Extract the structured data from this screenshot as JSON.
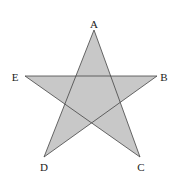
{
  "diagram": {
    "type": "pentagram",
    "fill": "#c8c8c8",
    "stroke": "#444444",
    "vertices": [
      {
        "label": "A",
        "x": 94,
        "y": 30,
        "lx": 94,
        "ly": 28
      },
      {
        "label": "B",
        "x": 157,
        "y": 76,
        "lx": 164,
        "ly": 81
      },
      {
        "label": "C",
        "x": 140,
        "y": 157,
        "lx": 141,
        "ly": 171
      },
      {
        "label": "D",
        "x": 44,
        "y": 157,
        "lx": 44,
        "ly": 171
      },
      {
        "label": "E",
        "x": 25,
        "y": 76,
        "lx": 15,
        "ly": 81
      }
    ],
    "path_order": [
      "A",
      "C",
      "E",
      "B",
      "D"
    ]
  }
}
